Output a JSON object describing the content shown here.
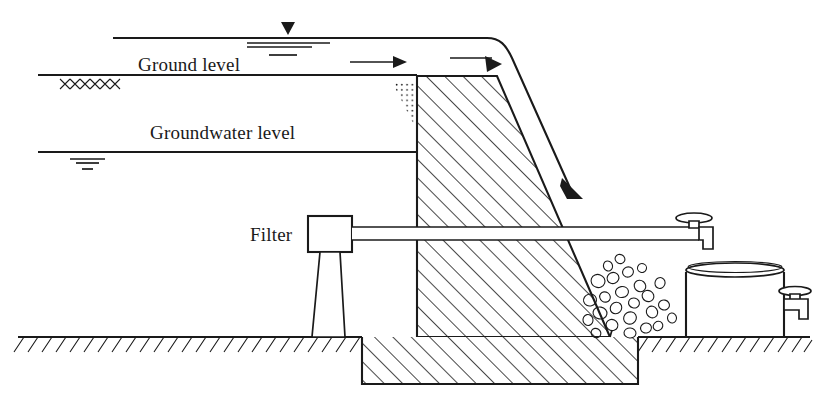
{
  "figure": {
    "type": "engineering-cross-section",
    "background_color": "#ffffff",
    "ink_color": "#1a1a1a"
  },
  "labels": {
    "ground_level": "Ground level",
    "groundwater_level": "Groundwater level",
    "filter": "Filter"
  },
  "symbols": {
    "water_table_marker": "filled-triangle-water-level-symbol",
    "groundwater_marker": "groundwater-level-symbol",
    "flow_arrow": "flow-direction-arrow",
    "spill_arrow": "overflow-spill-arrow",
    "cross_hatch_marker": "xxxx-soil-marker",
    "dotted_wedge": "silt-sediment-deposit",
    "rubble": "riprap-stone-apron",
    "ground_hatch": "ground-hatching",
    "dam_hatch": "dam-body-hatching"
  },
  "components": {
    "reservoir_water_surface": "reservoir-water-surface-line",
    "ground_surface": "ground-surface-line",
    "groundwater_surface": "groundwater-table-line",
    "dam_body": "dam-trapezoid-body",
    "dam_foundation": "dam-foundation-block",
    "filter_box": "filter-unit-box",
    "filter_stand": "filter-pedestal-stand",
    "outlet_pipe": "outlet-pipe",
    "pipe_tap": "pipe-outlet-tap",
    "storage_tank": "storage-tank",
    "tank_tap": "tank-outlet-tap"
  },
  "geometry": {
    "ground_level_y": 75,
    "groundwater_level_y": 152,
    "reservoir_surface_y": 38,
    "base_ground_y": 337,
    "dam_crest_y": 76,
    "dam_upstream_x": 417,
    "dam_crest_right_x": 497,
    "dam_toe_x": 610,
    "pipe_y": 233
  }
}
